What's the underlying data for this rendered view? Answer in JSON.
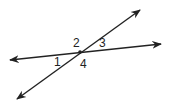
{
  "diagram": {
    "stroke_color": "#222222",
    "intersection": {
      "x": 80,
      "y": 52
    },
    "lines": [
      {
        "name": "line-a",
        "from": {
          "x": 8,
          "y": 60
        },
        "to": {
          "x": 163,
          "y": 44
        }
      },
      {
        "name": "line-b",
        "from": {
          "x": 16,
          "y": 100
        },
        "to": {
          "x": 141,
          "y": 9
        }
      }
    ],
    "angle_labels": [
      {
        "text": "1",
        "x": 54,
        "y": 66
      },
      {
        "text": "2",
        "x": 73,
        "y": 47
      },
      {
        "text": "3",
        "x": 99,
        "y": 47
      },
      {
        "text": "4",
        "x": 80,
        "y": 68
      }
    ]
  }
}
